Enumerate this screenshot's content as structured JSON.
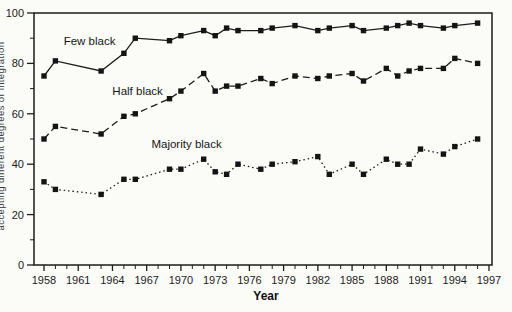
{
  "figure": {
    "background": "#fbfbf8",
    "ink": "#1c1c1c"
  },
  "chart_data": {
    "type": "line",
    "title": "",
    "xlabel": "Year",
    "ylabel": "accepting different degrees of integration",
    "xlim": [
      1958,
      1997
    ],
    "ylim": [
      0,
      100
    ],
    "grid": false,
    "legend": "inline-labels",
    "y_ticks": [
      0,
      20,
      40,
      60,
      80,
      100
    ],
    "y_minor_ticks": [
      10,
      30,
      50,
      70,
      90
    ],
    "x_labeled_ticks": [
      1958,
      1961,
      1964,
      1967,
      1970,
      1973,
      1976,
      1979,
      1982,
      1985,
      1988,
      1991,
      1994,
      1997
    ],
    "x": [
      1958,
      1959,
      1963,
      1965,
      1966,
      1969,
      1970,
      1972,
      1973,
      1974,
      1975,
      1977,
      1978,
      1980,
      1982,
      1983,
      1985,
      1986,
      1988,
      1989,
      1990,
      1991,
      1993,
      1994,
      1996
    ],
    "series": [
      {
        "name": "Few black",
        "line_style": "solid",
        "marker": "filled-square",
        "values": [
          75,
          81,
          77,
          84,
          90,
          89,
          91,
          93,
          91,
          94,
          93,
          93,
          94,
          95,
          93,
          94,
          95,
          93,
          94,
          95,
          96,
          95,
          94,
          95,
          96
        ],
        "label_at": {
          "x": 1962.0,
          "y": 89
        }
      },
      {
        "name": "Half black",
        "line_style": "dashed",
        "marker": "filled-square",
        "values": [
          50,
          55,
          52,
          59,
          60,
          66,
          69,
          76,
          69,
          71,
          71,
          74,
          72,
          75,
          74,
          75,
          76,
          73,
          78,
          75,
          77,
          78,
          78,
          82,
          80
        ],
        "label_at": {
          "x": 1966.2,
          "y": 69
        }
      },
      {
        "name": "Majority black",
        "line_style": "dotted",
        "marker": "filled-square",
        "values": [
          33,
          30,
          28,
          34,
          34,
          38,
          38,
          42,
          37,
          36,
          40,
          38,
          40,
          41,
          43,
          36,
          40,
          36,
          42,
          40,
          40,
          46,
          44,
          47,
          50
        ],
        "label_at": {
          "x": 1970.5,
          "y": 48
        }
      }
    ]
  }
}
